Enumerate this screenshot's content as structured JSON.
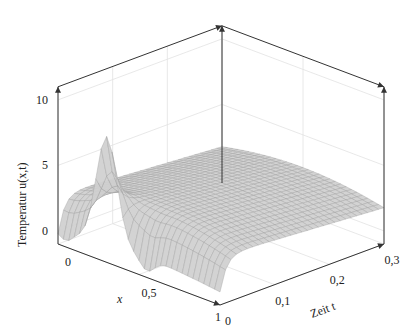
{
  "chart_data": {
    "type": "surface3d",
    "title": "",
    "xlabel": "x",
    "ylabel": "Zeit t",
    "zlabel": "Temperatur   u(x,t)",
    "xlim": [
      0,
      1
    ],
    "ylim": [
      0,
      0.3
    ],
    "zlim": [
      -1,
      11
    ],
    "x_ticks": [
      "0",
      "0,5",
      "1"
    ],
    "x_tick_values": [
      0,
      0.5,
      1
    ],
    "y_ticks": [
      "0",
      "0,1",
      "0,2",
      "0,3"
    ],
    "y_tick_values": [
      0,
      0.1,
      0.2,
      0.3
    ],
    "z_ticks": [
      "0",
      "5",
      "10"
    ],
    "z_tick_values": [
      0,
      5,
      10
    ],
    "grid": true,
    "surface": {
      "description": "Heat equation solution: initial profile with peak ~8 near x=0.3 and slight negative dips, decaying quickly toward a flat plateau ~3.5 that slowly decreases along t",
      "initial_peak": {
        "x": 0.3,
        "u": 8
      },
      "plateau_level": 3.5,
      "x_samples": 30,
      "t_samples": 30,
      "color": "#cfcfcf",
      "edge_color": "#9a9a9a"
    }
  }
}
